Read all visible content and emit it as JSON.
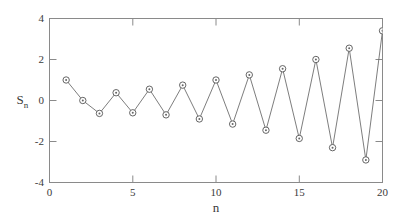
{
  "chart_data": {
    "type": "line",
    "title": "",
    "subtitle": "",
    "xlabel": "n",
    "ylabel": "S",
    "ylabel_subscript": "n",
    "x": [
      1,
      2,
      3,
      4,
      5,
      6,
      7,
      8,
      9,
      10,
      11,
      12,
      13,
      14,
      15,
      16,
      17,
      18,
      19,
      20
    ],
    "values": [
      1.0,
      0.0,
      -0.63,
      0.38,
      -0.6,
      0.55,
      -0.7,
      0.75,
      -0.9,
      1.0,
      -1.15,
      1.25,
      -1.45,
      1.55,
      -1.85,
      2.0,
      -2.3,
      2.55,
      -2.9,
      3.4
    ],
    "series": [
      {
        "name": "S_n",
        "values": [
          1.0,
          0.0,
          -0.63,
          0.38,
          -0.6,
          0.55,
          -0.7,
          0.75,
          -0.9,
          1.0,
          -1.15,
          1.25,
          -1.45,
          1.55,
          -1.85,
          2.0,
          -2.3,
          2.55,
          -2.9,
          3.4
        ]
      }
    ],
    "xlim": [
      0,
      20
    ],
    "ylim": [
      -4,
      4
    ],
    "xticks": [
      "0",
      "5",
      "10",
      "15",
      "20"
    ],
    "xtick_values": [
      0,
      5,
      10,
      15,
      20
    ],
    "yticks": [
      "4",
      "2",
      "0",
      "-2",
      "-4"
    ],
    "ytick_values": [
      4,
      2,
      0,
      -2,
      -4
    ],
    "grid": false,
    "legend": false,
    "legend_position": "none",
    "marker": "circle-open",
    "line_color": "#6e6e6e",
    "marker_color": "#555555",
    "axis_color": "#8a8a8a",
    "background": "#ffffff"
  }
}
